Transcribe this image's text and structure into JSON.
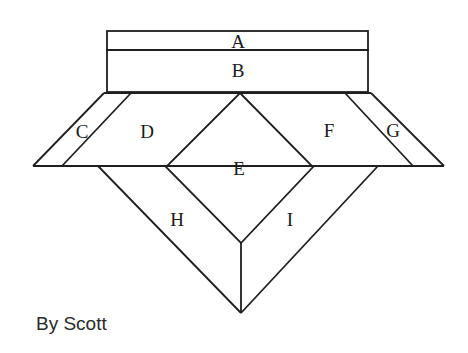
{
  "diagram": {
    "regions": [
      {
        "id": "A",
        "label": "A"
      },
      {
        "id": "B",
        "label": "B"
      },
      {
        "id": "C",
        "label": "C"
      },
      {
        "id": "D",
        "label": "D"
      },
      {
        "id": "E",
        "label": "E"
      },
      {
        "id": "F",
        "label": "F"
      },
      {
        "id": "G",
        "label": "G"
      },
      {
        "id": "H",
        "label": "H"
      },
      {
        "id": "I",
        "label": "I"
      }
    ],
    "line_color": "#1f1f1f",
    "background": "#ffffff"
  },
  "credit": {
    "text": "By Scott"
  }
}
